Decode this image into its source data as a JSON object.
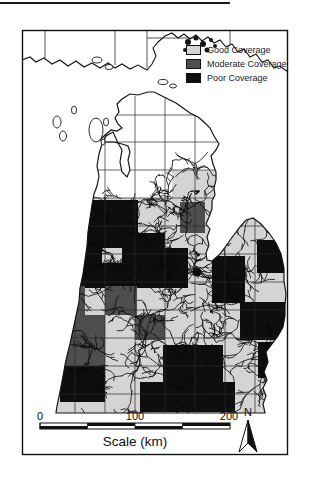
{
  "legend": {
    "items": [
      {
        "id": "good",
        "label": "Good Coverage",
        "color": "#d4d4d4"
      },
      {
        "id": "moderate",
        "label": "Moderate Coverage",
        "color": "#4e4e4e"
      },
      {
        "id": "poor",
        "label": "Poor Coverage",
        "color": "#0e0e0e"
      }
    ]
  },
  "scale_bar": {
    "ticks": [
      "0",
      "100",
      "200"
    ],
    "caption": "Scale (km)",
    "x_start": 40,
    "x_end": 230,
    "y": 423,
    "height": 6
  },
  "north_arrow": {
    "label": "N"
  },
  "map_colors": {
    "good": "#d4d4d4",
    "moderate": "#4e4e4e",
    "poor": "#0e0e0e",
    "outline": "#151515",
    "grid": "#2a2a2a",
    "unclassified": "#ffffff"
  },
  "map_geometry": {
    "frame": {
      "x": 22,
      "y": 30,
      "w": 266,
      "h": 425
    },
    "lp_path": "M148,92 L138,95 L130,94 L122,99 L117,104 L119,112 L115,118 L118,124 L122,128 L117,131 L111,130 L104,136 L100,140 L106,142 L114,142 L122,144 L128,146 L130,152 L128,160 L130,170 L127,177 L122,172 L120,162 L122,150 L118,143 L113,132 L106,136 L102,144 L99,154 L97,166 L99,176 L97,186 L94,194 L92,205 L90,218 L88,232 L87,246 L85,260 L83,274 L80,288 L79,302 L76,316 L73,330 L70,344 L66,360 L63,376 L60,392 L57,406 L56,413 L265,413 L263,404 L266,396 L263,388 L267,380 L264,372 L268,362 L266,352 L272,344 L278,336 L283,327 L285,316 L285,305 L286,294 L284,281 L284,268 L281,254 L276,243 L269,233 L261,224 L253,218 L246,220 L240,227 L233,236 L226,246 L219,255 L212,261 L207,260 L206,253 L209,245 L207,237 L210,229 L206,224 L209,217 L212,209 L212,201 L215,195 L214,188 L216,180 L216,172 L213,164 L211,156 L216,150 L219,144 L214,136 L210,128 L204,122 L198,117 L190,113 L183,108 L176,103 L168,99 L160,95 L154,92 Z",
    "classified_region": {
      "x": 22,
      "y": 170,
      "w": 266,
      "h": 245
    },
    "white_override": {
      "x": 75,
      "y": 170,
      "w": 97,
      "h": 28
    },
    "counties": [
      {
        "x": 68,
        "y": 200,
        "w": 70,
        "h": 48,
        "class": "poor"
      },
      {
        "x": 138,
        "y": 233,
        "w": 27,
        "h": 16,
        "class": "poor"
      },
      {
        "x": 58,
        "y": 248,
        "w": 44,
        "h": 16,
        "class": "poor"
      },
      {
        "x": 122,
        "y": 248,
        "w": 66,
        "h": 16,
        "class": "poor"
      },
      {
        "x": 68,
        "y": 263,
        "w": 120,
        "h": 25,
        "class": "poor"
      },
      {
        "x": 257,
        "y": 240,
        "w": 30,
        "h": 33,
        "class": "poor"
      },
      {
        "x": 212,
        "y": 256,
        "w": 33,
        "h": 47,
        "class": "poor"
      },
      {
        "x": 240,
        "y": 302,
        "w": 48,
        "h": 38,
        "class": "poor"
      },
      {
        "x": 258,
        "y": 342,
        "w": 28,
        "h": 36,
        "class": "poor"
      },
      {
        "x": 163,
        "y": 345,
        "w": 60,
        "h": 37,
        "class": "poor"
      },
      {
        "x": 140,
        "y": 382,
        "w": 95,
        "h": 30,
        "class": "poor"
      },
      {
        "x": 60,
        "y": 366,
        "w": 45,
        "h": 36,
        "class": "poor"
      },
      {
        "x": 180,
        "y": 202,
        "w": 25,
        "h": 31,
        "class": "moderate"
      },
      {
        "x": 50,
        "y": 286,
        "w": 35,
        "h": 29,
        "class": "moderate"
      },
      {
        "x": 105,
        "y": 286,
        "w": 32,
        "h": 29,
        "class": "moderate"
      },
      {
        "x": 50,
        "y": 315,
        "w": 55,
        "h": 25,
        "class": "moderate"
      },
      {
        "x": 135,
        "y": 315,
        "w": 30,
        "h": 25,
        "class": "moderate"
      },
      {
        "x": 58,
        "y": 340,
        "w": 47,
        "h": 26,
        "class": "moderate"
      }
    ],
    "grid": {
      "v": [
        75,
        105,
        135,
        165,
        195,
        225,
        255
      ],
      "v_extent": [
        96,
        413
      ],
      "h": [
        115,
        142,
        170,
        198,
        226,
        254,
        282,
        310,
        338,
        366,
        394
      ],
      "h_extent": [
        40,
        288
      ]
    },
    "up_shore": "M22,60 L30,57 L36,62 L44,58 L52,64 L60,60 L68,66 L76,61 L84,67 L92,63 L100,68 L108,63 L115,68 L122,64 L130,69 L138,65 L147,70 L152,64 L156,56 L153,48 L158,42 L165,36 L172,33 L178,38 L184,34 L190,39 L196,35 L202,41 L208,37 L214,43 L220,40 L226,47 L232,44 L238,52 L244,49 L250,57 L256,54 L262,62 L268,60 L274,68 L280,66 L288,72",
    "up_lines": [
      [
        45,
        30,
        45,
        58
      ],
      [
        115,
        30,
        115,
        65
      ],
      [
        147,
        30,
        147,
        68
      ],
      [
        230,
        30,
        230,
        45
      ],
      [
        147,
        38,
        195,
        38
      ]
    ],
    "up_island_blobs": [
      [
        188,
        42,
        3
      ],
      [
        196,
        38,
        2.5
      ],
      [
        203,
        44,
        3
      ],
      [
        211,
        40,
        2
      ],
      [
        198,
        50,
        2
      ],
      [
        185,
        50,
        2
      ],
      [
        207,
        50,
        2.5
      ],
      [
        215,
        46,
        2
      ]
    ],
    "lake_islands": [
      {
        "cx": 97,
        "cy": 60,
        "rx": 5,
        "ry": 3
      },
      {
        "cx": 109,
        "cy": 67,
        "rx": 4,
        "ry": 2.5
      },
      {
        "cx": 96,
        "cy": 130,
        "rx": 7,
        "ry": 12
      },
      {
        "cx": 106,
        "cy": 122,
        "rx": 2.5,
        "ry": 4
      },
      {
        "cx": 103,
        "cy": 142,
        "rx": 2,
        "ry": 3
      },
      {
        "cx": 57,
        "cy": 122,
        "rx": 4,
        "ry": 6
      },
      {
        "cx": 63,
        "cy": 136,
        "rx": 3.5,
        "ry": 5
      },
      {
        "cx": 74,
        "cy": 110,
        "rx": 2.5,
        "ry": 4
      },
      {
        "cx": 163,
        "cy": 82,
        "rx": 5,
        "ry": 2.5
      },
      {
        "cx": 173,
        "cy": 86,
        "rx": 3.5,
        "ry": 2
      }
    ],
    "dense_blob": {
      "cx": 197,
      "cy": 272,
      "r": 4.5
    },
    "streams": {
      "seed": 7,
      "count": 170,
      "x_min": 45,
      "x_max": 285,
      "y_min": 170,
      "y_max": 410
    }
  }
}
